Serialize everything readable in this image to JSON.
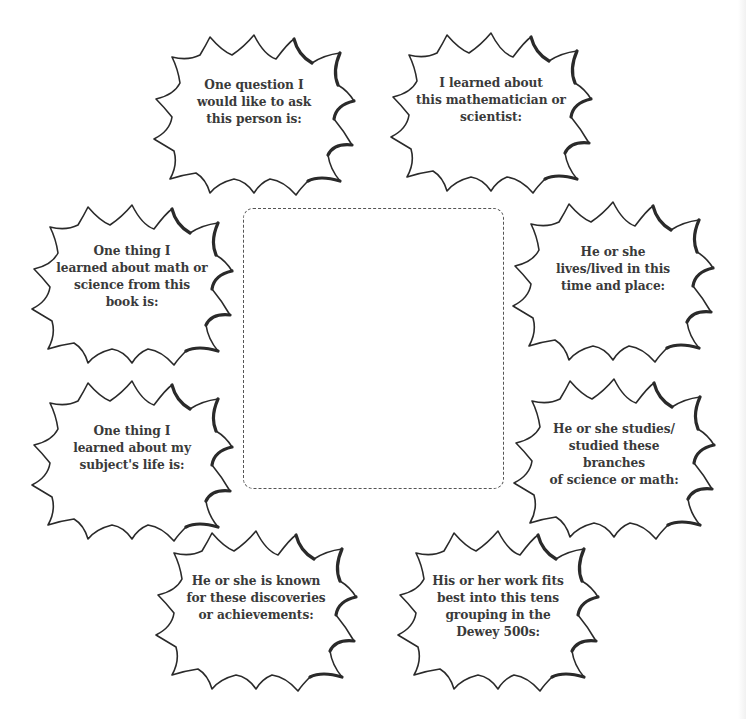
{
  "worksheet": {
    "center_frame": {
      "label": "",
      "style": "dashed-rounded-rectangle"
    },
    "bursts": [
      {
        "id": "question",
        "text": "One question I\nwould like to ask\nthis person is:"
      },
      {
        "id": "learned-about",
        "text": "I learned about\nthis mathematician or\nscientist:"
      },
      {
        "id": "math-science",
        "text": "One thing I\nlearned about math or\nscience from this\nbook  is:"
      },
      {
        "id": "time-place",
        "text": "He or she\nlives/lived in this\ntime and place:"
      },
      {
        "id": "subject-life",
        "text": "One thing I\nlearned about my\nsubject's life is:"
      },
      {
        "id": "branches",
        "text": "He or she studies/\nstudied these branches\nof science or math:"
      },
      {
        "id": "discoveries",
        "text": "He or she is known\nfor these discoveries\nor achievements:"
      },
      {
        "id": "dewey",
        "text": "His or her work fits\nbest into this tens\ngrouping in the\nDewey 500s:"
      }
    ]
  },
  "colors": {
    "outline": "#2a2a2a",
    "text": "#3a3a3a",
    "dash": "#555555",
    "background": "#ffffff"
  }
}
